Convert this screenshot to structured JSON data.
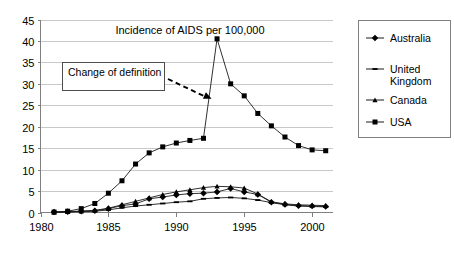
{
  "chart_data": {
    "type": "line",
    "title": "Incidence of AIDS per 100,000",
    "xlabel": "",
    "ylabel": "",
    "xlim": [
      1980,
      2001.5
    ],
    "ylim": [
      0,
      45
    ],
    "ytick_step": 5,
    "yticks": [
      "0",
      "5",
      "10",
      "15",
      "20",
      "25",
      "30",
      "35",
      "40",
      "45"
    ],
    "xticks": [
      "1980",
      "1985",
      "1990",
      "1995",
      "2000"
    ],
    "xtick_values": [
      1980,
      1985,
      1990,
      1995,
      2000
    ],
    "grid": "horizontal",
    "legend_position": "right-outside",
    "x": [
      1981,
      1982,
      1983,
      1984,
      1985,
      1986,
      1987,
      1988,
      1989,
      1990,
      1991,
      1992,
      1993,
      1994,
      1995,
      1996,
      1997,
      1998,
      1999,
      2000,
      2001
    ],
    "series": [
      {
        "name": "Australia",
        "marker": "diamond",
        "values": [
          0.1,
          0.2,
          0.3,
          0.4,
          0.9,
          1.6,
          2.0,
          3.2,
          3.6,
          4.1,
          4.4,
          4.5,
          4.8,
          5.6,
          4.8,
          4.2,
          2.4,
          1.9,
          1.6,
          1.5,
          1.4
        ]
      },
      {
        "name": "United Kingdom",
        "marker": "dash",
        "values": [
          0.05,
          0.1,
          0.2,
          0.3,
          0.6,
          1.1,
          1.5,
          1.8,
          2.1,
          2.4,
          2.6,
          3.2,
          3.4,
          3.5,
          3.3,
          2.9,
          2.3,
          1.8,
          1.5,
          1.4,
          1.3
        ]
      },
      {
        "name": "Canada",
        "marker": "triangle",
        "values": [
          0.05,
          0.15,
          0.3,
          0.5,
          1.0,
          1.8,
          2.6,
          3.4,
          4.2,
          4.8,
          5.3,
          5.8,
          6.1,
          6.0,
          5.7,
          4.3,
          2.5,
          2.0,
          1.8,
          1.7,
          1.6
        ]
      },
      {
        "name": "USA",
        "marker": "square",
        "values": [
          0.1,
          0.3,
          0.9,
          2.1,
          4.5,
          7.4,
          11.3,
          13.9,
          15.3,
          16.2,
          16.8,
          17.3,
          40.5,
          30.0,
          27.2,
          23.1,
          20.2,
          17.6,
          15.6,
          14.6,
          14.4
        ]
      }
    ],
    "annotations": [
      {
        "text": "Change of definition",
        "type": "box-with-arrow",
        "arrow_target_x": 1992.6,
        "arrow_target_y": 26.5
      }
    ]
  },
  "legend": {
    "entries": [
      {
        "label": "Australia",
        "marker": "diamond"
      },
      {
        "label": "United Kingdom",
        "label_line1": "United",
        "label_line2": "Kingdom",
        "marker": "dash"
      },
      {
        "label": "Canada",
        "marker": "triangle"
      },
      {
        "label": "USA",
        "marker": "square"
      }
    ]
  },
  "colors": {
    "series": "#1a1a1a",
    "grid": "#c8c8c8",
    "axis": "#808080",
    "background": "#ffffff",
    "text": "#000000"
  }
}
